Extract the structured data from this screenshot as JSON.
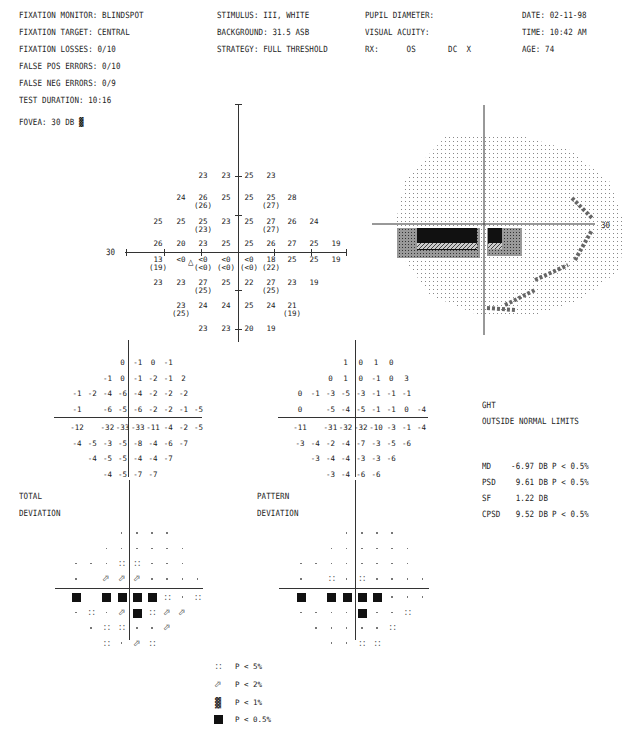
{
  "header": {
    "left": [
      "FIXATION MONITOR: BLINDSPOT",
      "FIXATION TARGET: CENTRAL",
      "FIXATION LOSSES: 0/10",
      "FALSE POS ERRORS: 0/10",
      "FALSE NEG ERRORS: 0/9",
      "TEST DURATION: 10:16"
    ],
    "fovea": "FOVEA: 30 DB",
    "fovea_symbol": "p1-icon",
    "middle": [
      "STIMULUS: III, WHITE",
      "BACKGROUND: 31.5 ASB",
      "STRATEGY: FULL THRESHOLD"
    ],
    "pupil": [
      "PUPIL DIAMETER:",
      "VISUAL ACUITY:",
      "RX:      OS       DC  X"
    ],
    "right": [
      "DATE: 02-11-98",
      "TIME: 10:42 AM",
      "AGE: 74"
    ]
  },
  "threshold_plot": {
    "axis_label_left": "30",
    "rows": [
      {
        "y": 176,
        "cells": [
          {
            "x": 203,
            "v": "23"
          },
          {
            "x": 226,
            "v": "23"
          },
          {
            "x": 249,
            "v": "25"
          },
          {
            "x": 271,
            "v": "23"
          }
        ]
      },
      {
        "y": 198,
        "cells": [
          {
            "x": 181,
            "v": "24"
          },
          {
            "x": 203,
            "v": "26",
            "p": "(26)"
          },
          {
            "x": 226,
            "v": "25"
          },
          {
            "x": 249,
            "v": "25"
          },
          {
            "x": 271,
            "v": "25",
            "p": "(27)"
          },
          {
            "x": 292,
            "v": "28"
          }
        ]
      },
      {
        "y": 222,
        "cells": [
          {
            "x": 158,
            "v": "25"
          },
          {
            "x": 181,
            "v": "25"
          },
          {
            "x": 203,
            "v": "25",
            "p": "(23)"
          },
          {
            "x": 226,
            "v": "23"
          },
          {
            "x": 249,
            "v": "25"
          },
          {
            "x": 271,
            "v": "27",
            "p": "(27)"
          },
          {
            "x": 292,
            "v": "26"
          },
          {
            "x": 314,
            "v": "24"
          }
        ]
      },
      {
        "y": 244,
        "cells": [
          {
            "x": 158,
            "v": "26"
          },
          {
            "x": 181,
            "v": "20"
          },
          {
            "x": 203,
            "v": "23"
          },
          {
            "x": 226,
            "v": "25"
          },
          {
            "x": 249,
            "v": "25"
          },
          {
            "x": 271,
            "v": "26"
          },
          {
            "x": 292,
            "v": "27"
          },
          {
            "x": 314,
            "v": "25"
          },
          {
            "x": 336,
            "v": "19"
          }
        ]
      },
      {
        "y": 260,
        "cells": [
          {
            "x": 158,
            "v": "13",
            "p": "(19)"
          },
          {
            "x": 181,
            "v": "<0"
          },
          {
            "x": 203,
            "v": "<0",
            "p": "(<0)"
          },
          {
            "x": 226,
            "v": "<0",
            "p": "(<0)"
          },
          {
            "x": 249,
            "v": "<0",
            "p": "(<0)"
          },
          {
            "x": 271,
            "v": "18",
            "p": "(22)"
          },
          {
            "x": 292,
            "v": "25"
          },
          {
            "x": 314,
            "v": "25"
          },
          {
            "x": 336,
            "v": "19"
          }
        ]
      },
      {
        "y": 283,
        "cells": [
          {
            "x": 158,
            "v": "23"
          },
          {
            "x": 181,
            "v": "23"
          },
          {
            "x": 203,
            "v": "27",
            "p": "(25)"
          },
          {
            "x": 226,
            "v": "25"
          },
          {
            "x": 249,
            "v": "22"
          },
          {
            "x": 271,
            "v": "27",
            "p": "(25)"
          },
          {
            "x": 292,
            "v": "23"
          },
          {
            "x": 314,
            "v": "19"
          }
        ]
      },
      {
        "y": 306,
        "cells": [
          {
            "x": 181,
            "v": "23",
            "p": "(25)"
          },
          {
            "x": 203,
            "v": "24"
          },
          {
            "x": 226,
            "v": "24"
          },
          {
            "x": 249,
            "v": "25"
          },
          {
            "x": 271,
            "v": "24"
          },
          {
            "x": 292,
            "v": "21",
            "p": "(19)"
          }
        ]
      },
      {
        "y": 329,
        "cells": [
          {
            "x": 203,
            "v": "23"
          },
          {
            "x": 226,
            "v": "23"
          },
          {
            "x": 249,
            "v": "20"
          },
          {
            "x": 271,
            "v": "19"
          }
        ]
      }
    ],
    "blindspot_marker": "triangle-icon"
  },
  "grayscale_plot": {
    "axis_label_right": "30"
  },
  "total_deviation_numeric": [
    [
      "",
      "",
      "",
      "0",
      "-1",
      "0",
      "-1",
      "",
      ""
    ],
    [
      "",
      "",
      "-1",
      "0",
      "-1",
      "-2",
      "-1",
      "2",
      ""
    ],
    [
      "-1",
      "-2",
      "-4",
      "-6",
      "-4",
      "-2",
      "-2",
      "-2",
      ""
    ],
    [
      "-1",
      "",
      "-6",
      "-5",
      "-6",
      "-2",
      "-2",
      "-1",
      "-5"
    ],
    [
      "-12",
      "",
      "-32",
      "-33",
      "-33",
      "-11",
      "-4",
      "-2",
      "-5"
    ],
    [
      "-4",
      "-5",
      "-3",
      "-5",
      "-8",
      "-4",
      "-6",
      "-7",
      ""
    ],
    [
      "",
      "-4",
      "-5",
      "-5",
      "-4",
      "-4",
      "-7",
      "",
      ""
    ],
    [
      "",
      "",
      "-4",
      "-5",
      "-7",
      "-7",
      "",
      "",
      ""
    ]
  ],
  "pattern_deviation_numeric": [
    [
      "",
      "",
      "",
      "1",
      "0",
      "1",
      "0",
      "",
      ""
    ],
    [
      "",
      "",
      "0",
      "1",
      "0",
      "-1",
      "0",
      "3",
      ""
    ],
    [
      "0",
      "-1",
      "-3",
      "-5",
      "-3",
      "-1",
      "-1",
      "-1",
      ""
    ],
    [
      "0",
      "",
      "-5",
      "-4",
      "-5",
      "-1",
      "-1",
      "0",
      "-4"
    ],
    [
      "-11",
      "",
      "-31",
      "-32",
      "-32",
      "-10",
      "-3",
      "-1",
      "-4"
    ],
    [
      "-3",
      "-4",
      "-2",
      "-4",
      "-7",
      "-3",
      "-5",
      "-6",
      ""
    ],
    [
      "",
      "-3",
      "-4",
      "-4",
      "-3",
      "-3",
      "-6",
      "",
      ""
    ],
    [
      "",
      "",
      "-3",
      "-4",
      "-6",
      "-6",
      "",
      "",
      ""
    ]
  ],
  "total_deviation_prob": {
    "label_line1": "TOTAL",
    "label_line2": "DEVIATION",
    "grid": [
      [
        "",
        "",
        "",
        ".",
        ".",
        ".",
        ".",
        "",
        ""
      ],
      [
        "",
        "",
        ".",
        ".",
        ".",
        ".",
        ".",
        ".",
        ""
      ],
      [
        ".",
        ".",
        ".",
        "p5",
        "p5",
        ".",
        ".",
        ".",
        ""
      ],
      [
        ".",
        "",
        "p2",
        "p2",
        "p2",
        ".",
        ".",
        ".",
        "."
      ],
      [
        "p05",
        "",
        "p05",
        "p05",
        "p05",
        "p05",
        "p5",
        ".",
        "p5"
      ],
      [
        ".",
        "p5",
        ".",
        "p2",
        "p05",
        "p5",
        "p2",
        "p2",
        ""
      ],
      [
        "",
        ".",
        "p5",
        "p5",
        ".",
        ".",
        "p2",
        "",
        ""
      ],
      [
        "",
        "",
        "p5",
        ".",
        "p2",
        "p5",
        "",
        "",
        ""
      ]
    ]
  },
  "pattern_deviation_prob": {
    "label_line1": "PATTERN",
    "label_line2": "DEVIATION",
    "grid": [
      [
        "",
        "",
        "",
        ".",
        ".",
        ".",
        ".",
        "",
        ""
      ],
      [
        "",
        "",
        ".",
        ".",
        ".",
        ".",
        ".",
        ".",
        ""
      ],
      [
        ".",
        ".",
        ".",
        ".",
        ".",
        ".",
        ".",
        ".",
        ""
      ],
      [
        ".",
        "",
        "p5",
        ".",
        "p5",
        ".",
        ".",
        ".",
        "."
      ],
      [
        "p05",
        "",
        "p05",
        "p05",
        "p05",
        "p05",
        ".",
        ".",
        "."
      ],
      [
        ".",
        ".",
        ".",
        ".",
        "p05",
        ".",
        ".",
        "p5",
        ""
      ],
      [
        "",
        ".",
        ".",
        ".",
        ".",
        ".",
        "p5",
        "",
        ""
      ],
      [
        "",
        "",
        ".",
        ".",
        "p5",
        "p5",
        "",
        "",
        ""
      ]
    ]
  },
  "global_indices": {
    "ght_label": "GHT",
    "ght_result": "OUTSIDE NORMAL LIMITS",
    "rows": [
      {
        "name": "MD",
        "value": "-6.97 DB",
        "p": "P < 0.5%"
      },
      {
        "name": "PSD",
        "value": "9.61 DB",
        "p": "P < 0.5%"
      },
      {
        "name": "SF",
        "value": "1.22 DB",
        "p": ""
      },
      {
        "name": "CPSD",
        "value": "9.52 DB",
        "p": "P < 0.5%"
      }
    ]
  },
  "legend": [
    {
      "symbol": "p5-icon",
      "label": "P < 5%"
    },
    {
      "symbol": "p2-icon",
      "label": "P < 2%"
    },
    {
      "symbol": "p1-icon",
      "label": "P < 1%"
    },
    {
      "symbol": "p05-icon",
      "label": "P < 0.5%"
    }
  ]
}
